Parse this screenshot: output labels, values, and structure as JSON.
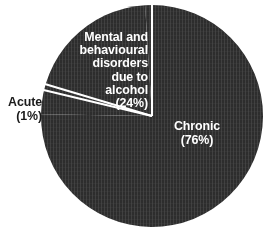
{
  "chart_data": {
    "type": "pie",
    "title": "",
    "subtitle": "",
    "xlabel": "",
    "ylabel": "",
    "legend_position": "none",
    "grid": false,
    "units": "percent",
    "categories": [
      "Chronic",
      "Mental and behavioural disorders due to alcohol",
      "Acute"
    ],
    "values": [
      76,
      24,
      1
    ],
    "slices": [
      {
        "name": "chronic",
        "label": "Chronic",
        "value": 76,
        "value_text": "(76%)",
        "label_text": "Chronic\n(76%)",
        "color": "#2d2d2d",
        "label_color": "#ffffff",
        "label_placement": "inside"
      },
      {
        "name": "mental-and-behavioural-disorders-due-to-alcohol",
        "label": "Mental and behavioural disorders due to alcohol",
        "value": 24,
        "value_text": "(24%)",
        "label_text": "Mental and\nbehavioural\ndisorders\ndue to\nalcohol\n(24%)",
        "color": "#2d2d2d",
        "label_color": "#ffffff",
        "label_placement": "inside"
      },
      {
        "name": "acute",
        "label": "Acute",
        "value": 1,
        "value_text": "(1%)",
        "label_text": "Acute\n(1%)",
        "color": "#2d2d2d",
        "label_color": "#1a1a1a",
        "label_placement": "outside"
      }
    ],
    "annotations": []
  },
  "style": {
    "background": "#ffffff",
    "slice_fill": "#2d2d2d",
    "divider_color": "#ffffff",
    "inside_label_color": "#ffffff",
    "outside_label_color": "#1a1a1a"
  }
}
